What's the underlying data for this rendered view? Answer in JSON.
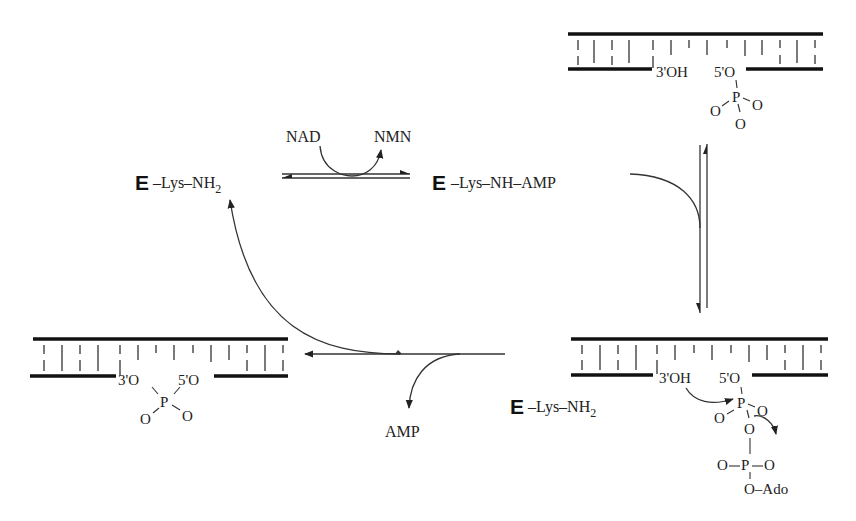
{
  "diagram": {
    "type": "reaction-cycle",
    "species": {
      "enzyme_free_top": {
        "enzyme": "E",
        "label": "–Lys–NH",
        "subscript": "2"
      },
      "enzyme_adenylate": {
        "enzyme": "E",
        "label": "–Lys–NH–AMP"
      },
      "enzyme_free_bottom": {
        "enzyme": "E",
        "label": "–Lys–NH",
        "subscript": "2"
      }
    },
    "cofactors": {
      "substrate_in": "NAD",
      "product_out": "NMN",
      "released": "AMP"
    },
    "nicked_dna": {
      "three_prime": "3'OH",
      "five_prime": "5'O",
      "phosphate": "P",
      "oxygens": [
        "O",
        "O",
        "O"
      ]
    },
    "adenylated_dna": {
      "three_prime": "3'OH",
      "five_prime": "5'O",
      "phosphate_1": "P",
      "bridge_oxygen": "O",
      "phosphate_2": "P",
      "o_left": "O",
      "o_right": "O",
      "o_side_left": "O",
      "o_side_right": "O",
      "adenosine": "O–Ado"
    },
    "sealed_dna": {
      "three_prime": "3'O",
      "five_prime": "5'O",
      "phosphate": "P",
      "oxygens": [
        "O",
        "O"
      ]
    }
  }
}
